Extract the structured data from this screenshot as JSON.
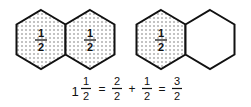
{
  "diagram": {
    "groups": [
      {
        "name": "one-and-half-left",
        "hexagons": [
          {
            "shaded": true,
            "label": {
              "numerator": "1",
              "denominator": "2"
            }
          },
          {
            "shaded": true,
            "label": {
              "numerator": "1",
              "denominator": "2"
            }
          }
        ]
      },
      {
        "name": "one-and-half-right",
        "hexagons": [
          {
            "shaded": true,
            "label": {
              "numerator": "1",
              "denominator": "2"
            }
          },
          {
            "shaded": false,
            "label": null
          }
        ]
      }
    ],
    "equation": {
      "whole": "1",
      "terms": [
        {
          "numerator": "1",
          "denominator": "2"
        },
        {
          "numerator": "2",
          "denominator": "2"
        },
        {
          "numerator": "1",
          "denominator": "2"
        },
        {
          "numerator": "3",
          "denominator": "2"
        }
      ],
      "operators": [
        "=",
        "+",
        "="
      ]
    },
    "colors": {
      "stroke": "#111111",
      "dot": "#6a6a6a",
      "background": "#ffffff"
    }
  }
}
